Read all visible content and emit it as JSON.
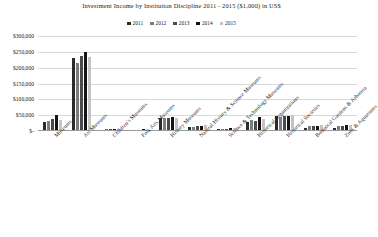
{
  "chart_data": {
    "type": "bar",
    "title": "Investment Income by Institution Discipline 2011 - 2015 ($1,000) in US$",
    "xlabel": "",
    "ylabel": "",
    "ylim": [
      0,
      300000
    ],
    "ytick_labels": [
      "$300,000",
      "$250,000",
      "$200,000",
      "$150,000",
      "$100,000",
      "$50,000",
      "$-"
    ],
    "ytick_values": [
      300000,
      250000,
      200000,
      150000,
      100000,
      50000,
      0
    ],
    "grid": true,
    "legend_position": "top-center",
    "categories": [
      "Museums",
      "Art Museums",
      "Children's Museums",
      "Folk Arts Museums",
      "History Museums",
      "Natural History & Science Museums",
      "Science & Technology Museums",
      "Historical Organizations",
      "Historical Societies",
      "Botanical Gardens & Arboreta",
      "Zoos & Aquariums"
    ],
    "series": [
      {
        "name": "2011",
        "color": "#2b2b2b",
        "values": [
          28000,
          231000,
          4000,
          3000,
          41000,
          12000,
          5000,
          28000,
          47000,
          9000,
          10000
        ]
      },
      {
        "name": "2012",
        "color": "#7d7d7d",
        "values": [
          31000,
          214000,
          5000,
          4000,
          42000,
          14000,
          6000,
          35000,
          44000,
          15000,
          17000
        ]
      },
      {
        "name": "2013",
        "color": "#4a4a4a",
        "values": [
          37000,
          236000,
          5000,
          4000,
          41000,
          15000,
          7000,
          32000,
          46000,
          16000,
          17000
        ]
      },
      {
        "name": "2014",
        "color": "#141414",
        "values": [
          49000,
          251000,
          6000,
          5000,
          43000,
          17000,
          8000,
          45000,
          48000,
          17000,
          18000
        ]
      },
      {
        "name": "2015",
        "color": "#c4c4c4",
        "values": [
          36000,
          234000,
          5000,
          4000,
          42000,
          19000,
          8000,
          38000,
          52000,
          19000,
          20000
        ]
      }
    ]
  }
}
